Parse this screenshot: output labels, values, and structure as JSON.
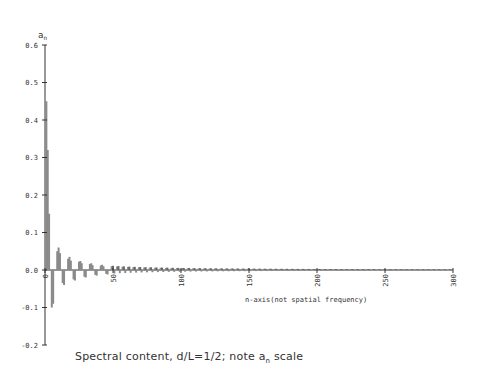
{
  "chart_data": {
    "type": "bar",
    "title": "",
    "caption": "Spectral content, d/L=1/2; note a_n scale",
    "caption_parts": {
      "pre": "Spectral content, d/L=1/2; note a",
      "sub": "n",
      "post": " scale"
    },
    "xlabel": "n-axis(not spatial frequency)",
    "ylabel": "a_n",
    "ylabel_parts": {
      "main": "a",
      "sub": "n"
    },
    "xlim": [
      0,
      300
    ],
    "ylim": [
      -0.2,
      0.6
    ],
    "x_ticks": [
      0,
      50,
      100,
      150,
      200,
      250,
      300
    ],
    "x_tick_labels": [
      "0",
      "50",
      "100",
      "150",
      "200",
      "250",
      "300"
    ],
    "y_ticks": [
      -0.2,
      -0.1,
      0.0,
      0.1,
      0.2,
      0.3,
      0.4,
      0.5,
      0.6
    ],
    "y_tick_labels": [
      "-0.2",
      "-0.1",
      "0.0",
      "0.1",
      "0.2",
      "0.3",
      "0.4",
      "0.5",
      "0.6"
    ],
    "grid": false,
    "x": [
      1,
      2,
      3,
      5,
      6,
      7,
      9,
      10,
      11,
      13,
      14,
      15,
      17,
      18,
      19,
      21,
      22,
      23,
      25,
      26,
      27,
      29,
      30,
      31,
      33,
      34,
      35,
      37,
      38,
      39,
      41,
      42,
      43,
      45,
      46,
      47
    ],
    "values": [
      0.45,
      0.32,
      0.15,
      -0.1,
      -0.09,
      0.0,
      0.05,
      0.06,
      0.045,
      -0.035,
      -0.04,
      0.0,
      0.03,
      0.035,
      0.025,
      -0.025,
      -0.028,
      0.0,
      0.022,
      0.024,
      0.018,
      -0.018,
      -0.02,
      0.0,
      0.016,
      0.018,
      0.013,
      -0.013,
      -0.015,
      0.0,
      0.012,
      0.014,
      0.01,
      -0.01,
      -0.012,
      0.0
    ],
    "decay_note": "Alternating-sign oscillation continues with decaying amplitude (~1/n) out to n=300"
  },
  "colors": {
    "axis": "#333333",
    "bar": "#8a8a8a",
    "bar_dark": "#666666"
  }
}
